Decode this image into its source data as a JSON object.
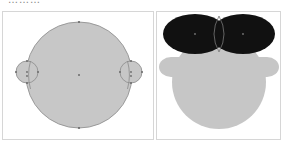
{
  "caption": {
    "text": "………"
  },
  "figure": {
    "left_panel": {
      "label": "construction-view",
      "head_fill": "#c7c7c7",
      "stroke": "#8a8a8a",
      "point_color": "#6a6a6a"
    },
    "right_panel": {
      "label": "rendered-view",
      "hair_fill": "#111111",
      "face_fill": "#c6c6c6",
      "outline": "#777777"
    }
  }
}
